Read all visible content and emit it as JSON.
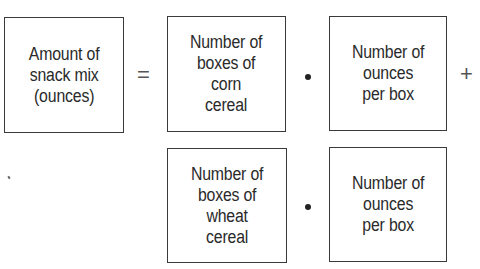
{
  "diagram": {
    "lhs": {
      "label": "Amount of\nsnack mix\n(ounces)"
    },
    "equals": "=",
    "plus": "+",
    "rows": [
      {
        "factor1": "Number of\nboxes of\ncorn\ncereal",
        "factor2": "Number of\nounces\nper box"
      },
      {
        "factor1": "Number of\nboxes of\nwheat\ncereal",
        "factor2": "Number of\nounces\nper box"
      }
    ],
    "multiply_symbol": "•"
  }
}
